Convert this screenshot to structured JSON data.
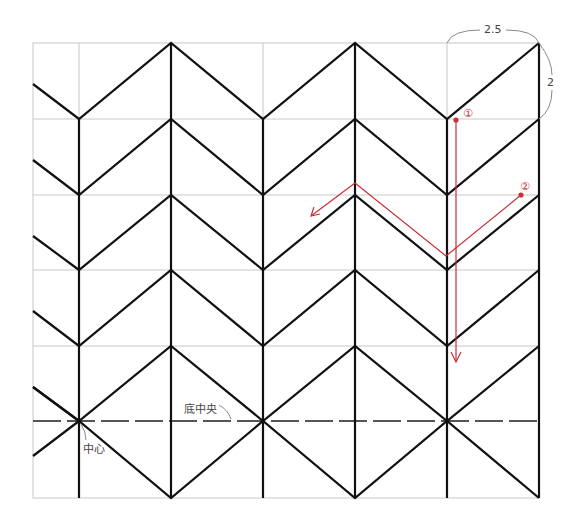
{
  "diagram": {
    "type": "pattern-fold-diagram",
    "dimensions": {
      "width_label": "2.5",
      "height_label": "2"
    },
    "labels": {
      "center": "中心",
      "bottom_center": "底中央",
      "step1": "①",
      "step2": "②"
    },
    "colors": {
      "grid": "#c8c8c8",
      "lines": "#111111",
      "dashed": "#555555",
      "annotation": "#c8303a",
      "dimension": "#777777"
    },
    "grid": {
      "x": [
        33,
        79,
        171,
        263,
        355,
        447,
        539
      ],
      "y": [
        43,
        119,
        195,
        270,
        346,
        421,
        498
      ]
    }
  }
}
